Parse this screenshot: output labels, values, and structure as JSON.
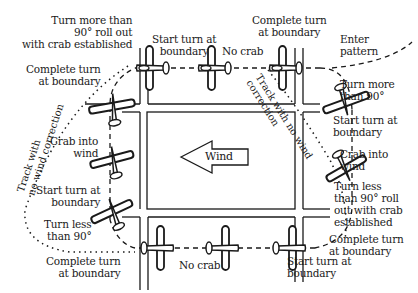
{
  "diagram": {
    "type": "traffic-pattern-wind-correction",
    "wind_label": "Wind",
    "wind_direction": "left",
    "colors": {
      "ink": "#1a1a1a",
      "background": "#ffffff"
    }
  },
  "labels": {
    "top_left_turn": "Turn more than\n90° roll out\nwith crab established",
    "top_start_turn": "Start turn at\nboundary",
    "top_no_crab": "No crab",
    "top_complete_turn": "Complete turn\nat boundary",
    "enter_pattern": "Enter\npattern",
    "left_complete_turn": "Complete turn\nat boundary",
    "right_turn_more": "Turn more\nthan 90°",
    "right_start_turn": "Start turn at\nboundary",
    "left_crab_into_wind": "Crab into\nwind",
    "right_crab_into_wind": "Crab into\nwind",
    "left_start_turn": "Start turn at\nboundary",
    "right_turn_less": "Turn less\nthan 90° roll\nout with crab\nestablished",
    "left_turn_less": "Turn less\nthan 90°",
    "right_complete_turn": "Complete turn\nat boundary",
    "bottom_complete_turn": "Complete turn\nat boundary",
    "bottom_no_crab": "No crab",
    "bottom_start_turn": "Start turn at\nboundary",
    "track_left": "Track with\nno wind correction",
    "track_right": "Track with no wind\ncorrection"
  }
}
